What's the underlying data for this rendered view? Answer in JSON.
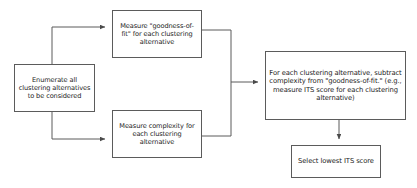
{
  "diagram": {
    "background_color": "#ffffff",
    "line_color": "#5b5b5b",
    "text_color": "#1c1c1c",
    "nodes": [
      {
        "id": "enumerate",
        "label": "Enumerate all clustering alternatives to be considered"
      },
      {
        "id": "goodness",
        "label": "Measure \"goodness-of-fit\" for each clustering alternative"
      },
      {
        "id": "complexity",
        "label": "Measure complexity for each clustering alternative"
      },
      {
        "id": "subtract",
        "label": "For each clustering alternative, subtract complexity from \"goodness-of-fit.\" (e.g., measure ITS score for each clustering alternative)"
      },
      {
        "id": "select",
        "label": "Select lowest ITS score"
      }
    ],
    "edges": [
      {
        "from": "enumerate",
        "to": "goodness"
      },
      {
        "from": "enumerate",
        "to": "complexity"
      },
      {
        "from": "goodness",
        "to": "subtract"
      },
      {
        "from": "complexity",
        "to": "subtract"
      },
      {
        "from": "subtract",
        "to": "select"
      }
    ]
  }
}
